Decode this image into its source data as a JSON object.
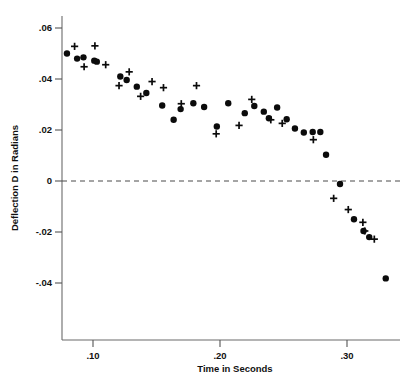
{
  "chart_data": {
    "type": "scatter",
    "title": "",
    "subtitle": "",
    "xlabel": "Time in Seconds",
    "ylabel": "Deflection D in Radians",
    "xlim": [
      0.0756,
      0.3425
    ],
    "ylim": [
      -0.0505,
      0.0642
    ],
    "xticks": [
      0.1,
      0.2,
      0.3
    ],
    "xtick_labels": [
      ".10",
      ".20",
      ".30"
    ],
    "yticks": [
      0.06,
      0.04,
      0.02,
      0.0,
      -0.02,
      -0.04
    ],
    "ytick_labels": [
      ".06",
      ".04",
      ".02",
      "0",
      "-.02",
      "-.04"
    ],
    "grid": false,
    "legend": null,
    "annotations": [
      {
        "type": "hline",
        "y": 0.0,
        "style": "dashed",
        "label": "zero deflection reference"
      }
    ],
    "series": [
      {
        "name": "series-dots",
        "marker": "filled-circle",
        "color": "#0b0b0b",
        "points": [
          {
            "x": 0.0795,
            "y": 0.05
          },
          {
            "x": 0.0875,
            "y": 0.048
          },
          {
            "x": 0.0925,
            "y": 0.0485
          },
          {
            "x": 0.101,
            "y": 0.0472
          },
          {
            "x": 0.103,
            "y": 0.0468
          },
          {
            "x": 0.1215,
            "y": 0.041
          },
          {
            "x": 0.1265,
            "y": 0.0396
          },
          {
            "x": 0.1345,
            "y": 0.037
          },
          {
            "x": 0.142,
            "y": 0.0345
          },
          {
            "x": 0.1545,
            "y": 0.0296
          },
          {
            "x": 0.1635,
            "y": 0.024
          },
          {
            "x": 0.169,
            "y": 0.0282
          },
          {
            "x": 0.179,
            "y": 0.0305
          },
          {
            "x": 0.1875,
            "y": 0.029
          },
          {
            "x": 0.1975,
            "y": 0.0214
          },
          {
            "x": 0.2065,
            "y": 0.0305
          },
          {
            "x": 0.2195,
            "y": 0.0266
          },
          {
            "x": 0.227,
            "y": 0.0294
          },
          {
            "x": 0.2345,
            "y": 0.0272
          },
          {
            "x": 0.2385,
            "y": 0.0246
          },
          {
            "x": 0.245,
            "y": 0.0288
          },
          {
            "x": 0.2525,
            "y": 0.0242
          },
          {
            "x": 0.259,
            "y": 0.0206
          },
          {
            "x": 0.266,
            "y": 0.019
          },
          {
            "x": 0.273,
            "y": 0.0192
          },
          {
            "x": 0.279,
            "y": 0.0192
          },
          {
            "x": 0.2835,
            "y": 0.0103
          },
          {
            "x": 0.2945,
            "y": -0.0012
          },
          {
            "x": 0.3055,
            "y": -0.015
          },
          {
            "x": 0.313,
            "y": -0.0196
          },
          {
            "x": 0.3175,
            "y": -0.022
          },
          {
            "x": 0.3305,
            "y": -0.0382
          }
        ]
      },
      {
        "name": "series-plus",
        "marker": "plus",
        "color": "#0b0b0b",
        "points": [
          {
            "x": 0.0855,
            "y": 0.0528
          },
          {
            "x": 0.093,
            "y": 0.0448
          },
          {
            "x": 0.1015,
            "y": 0.053
          },
          {
            "x": 0.11,
            "y": 0.0456
          },
          {
            "x": 0.1205,
            "y": 0.0374
          },
          {
            "x": 0.1285,
            "y": 0.0428
          },
          {
            "x": 0.1375,
            "y": 0.0332
          },
          {
            "x": 0.1465,
            "y": 0.039
          },
          {
            "x": 0.1555,
            "y": 0.0366
          },
          {
            "x": 0.1695,
            "y": 0.0303
          },
          {
            "x": 0.1815,
            "y": 0.0374
          },
          {
            "x": 0.197,
            "y": 0.0185
          },
          {
            "x": 0.215,
            "y": 0.0218
          },
          {
            "x": 0.225,
            "y": 0.032
          },
          {
            "x": 0.24,
            "y": 0.024
          },
          {
            "x": 0.249,
            "y": 0.0226
          },
          {
            "x": 0.2735,
            "y": 0.0162
          },
          {
            "x": 0.2895,
            "y": -0.0068
          },
          {
            "x": 0.301,
            "y": -0.0112
          },
          {
            "x": 0.3125,
            "y": -0.0162
          },
          {
            "x": 0.314,
            "y": -0.0196
          },
          {
            "x": 0.3215,
            "y": -0.0228
          }
        ]
      }
    ]
  },
  "figure": {
    "ylabel": "Deflection D in Radians",
    "xlabel": "Time in Seconds"
  }
}
